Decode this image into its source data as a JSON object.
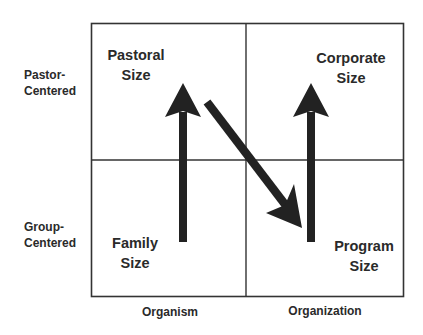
{
  "diagram": {
    "row_labels": {
      "top": [
        "Pastor-",
        "Centered"
      ],
      "bottom": [
        "Group-",
        "Centered"
      ]
    },
    "column_labels": {
      "left": "Organism",
      "right": "Organization"
    },
    "quadrants": {
      "top_left": [
        "Pastoral",
        "Size"
      ],
      "top_right": [
        "Corporate",
        "Size"
      ],
      "bottom_left": [
        "Family",
        "Size"
      ],
      "bottom_right": [
        "Program",
        "Size"
      ]
    },
    "arrows": [
      {
        "from": "Family Size",
        "to": "Pastoral Size",
        "direction": "up"
      },
      {
        "from": "Pastoral Size",
        "to": "Program Size",
        "direction": "diagonal-down-right"
      },
      {
        "from": "Program Size",
        "to": "Corporate Size",
        "direction": "up"
      }
    ],
    "colors": {
      "line": "#333333",
      "arrow": "#222222",
      "text": "#2a2a2a"
    }
  }
}
